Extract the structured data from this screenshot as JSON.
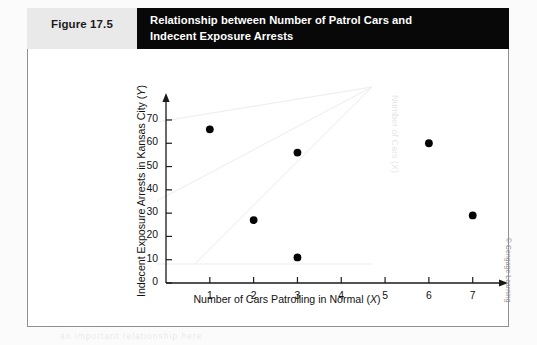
{
  "figure": {
    "number_label": "Figure 17.5",
    "title": "Relationship between Number of Patrol Cars and\nIndecent Exposure Arrests",
    "credit": "© Cengage Learning",
    "ghost_vertical": "Number of Cars (X)",
    "ghost_bottom": "an important relationship here"
  },
  "colors": {
    "title_band": "#080808",
    "number_band": "#e9e9ea",
    "frame_border": "#8d9096",
    "axis": "#1a1a1a",
    "marker": "#050505",
    "page": "#fbfbfb"
  },
  "chart_data": {
    "type": "scatter",
    "title": "Relationship between Number of Patrol Cars and Indecent Exposure Arrests",
    "xlabel": "Number of Cars Patrolling in Normal (X)",
    "ylabel": "Indecent Exposure Arrests in Kansas City (Y)",
    "xlim": [
      0,
      7.6
    ],
    "ylim": [
      0,
      76
    ],
    "xticks": [
      1,
      2,
      3,
      4,
      5,
      6,
      7
    ],
    "xticklabels": [
      "1",
      "2",
      "3",
      "4",
      "5",
      "6",
      "7"
    ],
    "yticks": [
      0,
      10,
      20,
      30,
      40,
      50,
      60,
      70
    ],
    "yticklabels": [
      "0",
      "10",
      "20",
      "30",
      "40",
      "50",
      "60",
      "70"
    ],
    "grid": false,
    "legend": false,
    "series": [
      {
        "name": "Patrol cars vs indecent exposure arrests",
        "marker": "filled-circle",
        "points": [
          {
            "x": 1,
            "y": 66
          },
          {
            "x": 2,
            "y": 27
          },
          {
            "x": 3,
            "y": 56
          },
          {
            "x": 3,
            "y": 11
          },
          {
            "x": 6,
            "y": 60
          },
          {
            "x": 7,
            "y": 29
          }
        ]
      }
    ]
  }
}
